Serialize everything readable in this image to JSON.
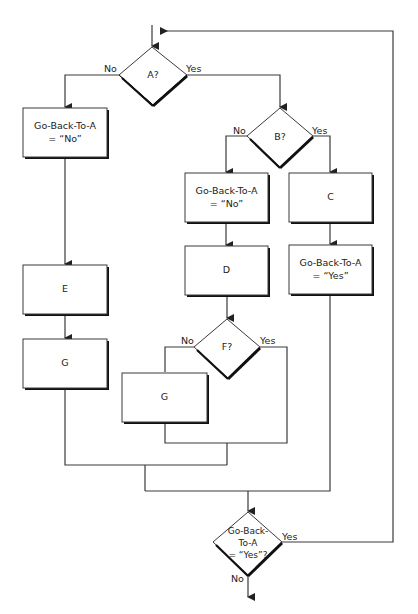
{
  "diagram": {
    "type": "flowchart",
    "nodes": {
      "decision_a": {
        "label": "A?",
        "yes": "Yes",
        "no": "No"
      },
      "box_left_goback_no": {
        "line1": "Go-Back-To-A",
        "line2": "= “No”"
      },
      "box_e": {
        "label": "E"
      },
      "box_g_left": {
        "label": "G"
      },
      "decision_b": {
        "label": "B?",
        "yes": "Yes",
        "no": "No"
      },
      "box_mid_goback_no": {
        "line1": "Go-Back-To-A",
        "line2": "= “No”"
      },
      "box_d": {
        "label": "D"
      },
      "decision_f": {
        "label": "F?",
        "yes": "Yes",
        "no": "No"
      },
      "box_g_mid": {
        "label": "G"
      },
      "box_c": {
        "label": "C"
      },
      "box_right_goback_yes": {
        "line1": "Go-Back-To-A",
        "line2": "= “Yes”"
      },
      "decision_goback": {
        "line1": "Go-Back-",
        "line2": "To-A",
        "line3": "= “Yes”?",
        "yes": "Yes",
        "no": "No"
      }
    },
    "colors": {
      "line": "#3a3a3a",
      "shadow": "#111111",
      "background": "#ffffff"
    }
  }
}
